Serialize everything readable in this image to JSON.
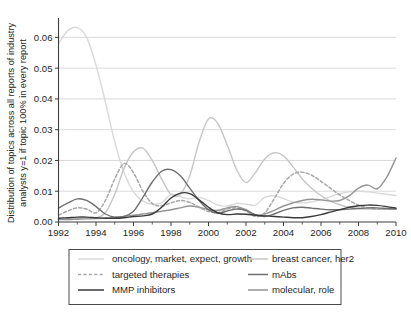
{
  "figure": {
    "ylabel_line1": "Distribution of topics across all reports of industry",
    "ylabel_line2": "analysts y=1 if topic 100% in every report"
  },
  "axes": {
    "y_ticks": [
      "0.00",
      "0.01",
      "0.02",
      "0.03",
      "0.04",
      "0.05",
      "0.06"
    ],
    "x_ticks": [
      "1992",
      "1994",
      "1996",
      "1998",
      "2000",
      "2002",
      "2004",
      "2006",
      "2008",
      "2010"
    ]
  },
  "legend": {
    "entries": [
      {
        "label": "oncology, market, expect, growth",
        "color": "#d9d9d9",
        "style": "solid"
      },
      {
        "label": "breast cancer, her2",
        "color": "#c6c6c6",
        "style": "solid"
      },
      {
        "label": "targeted therapies",
        "color": "#a8a8a8",
        "style": "dashed"
      },
      {
        "label": "mAbs",
        "color": "#6f6f6f",
        "style": "solid"
      },
      {
        "label": "MMP inhibitors",
        "color": "#3a3a3a",
        "style": "solid"
      },
      {
        "label": "molecular, role",
        "color": "#949494",
        "style": "solid"
      }
    ]
  },
  "chart_data": {
    "type": "line",
    "title": "",
    "xlabel": "",
    "ylabel": "Distribution of topics across all reports of industry analysts y=1 if topic 100% in every report",
    "xlim": [
      1992,
      2010
    ],
    "ylim": [
      0.0,
      0.065
    ],
    "grid": true,
    "legend_position": "below",
    "x": [
      1992,
      1992.5,
      1993,
      1993.5,
      1994,
      1994.5,
      1995,
      1995.5,
      1996,
      1996.5,
      1997,
      1997.5,
      1998,
      1998.5,
      1999,
      1999.5,
      2000,
      2000.5,
      2001,
      2001.5,
      2002,
      2002.5,
      2003,
      2003.5,
      2004,
      2004.5,
      2005,
      2005.5,
      2006,
      2006.5,
      2007,
      2007.5,
      2008,
      2008.5,
      2009,
      2009.5,
      2010
    ],
    "series": [
      {
        "name": "oncology, market, expect, growth",
        "color": "#d9d9d9",
        "style": "solid",
        "values": [
          0.058,
          0.0622,
          0.0632,
          0.06,
          0.051,
          0.039,
          0.026,
          0.016,
          0.0098,
          0.0068,
          0.0058,
          0.0062,
          0.009,
          0.0082,
          0.0075,
          0.008,
          0.007,
          0.0055,
          0.0052,
          0.006,
          0.0058,
          0.0055,
          0.008,
          0.0085,
          0.0076,
          0.0065,
          0.0062,
          0.0065,
          0.0072,
          0.0082,
          0.0092,
          0.0098,
          0.01,
          0.0098,
          0.0094,
          0.009,
          0.0086
        ]
      },
      {
        "name": "breast cancer, her2",
        "color": "#c6c6c6",
        "style": "solid",
        "values": [
          0.001,
          0.001,
          0.0012,
          0.0013,
          0.0014,
          0.003,
          0.009,
          0.0175,
          0.0228,
          0.024,
          0.02,
          0.014,
          0.009,
          0.009,
          0.015,
          0.026,
          0.0335,
          0.032,
          0.025,
          0.017,
          0.0128,
          0.016,
          0.0205,
          0.0225,
          0.0215,
          0.018,
          0.014,
          0.011,
          0.0086,
          0.0068,
          0.0056,
          0.0048,
          0.0044,
          0.0042,
          0.0042,
          0.0042,
          0.0044
        ]
      },
      {
        "name": "targeted therapies",
        "color": "#a8a8a8",
        "style": "dashed",
        "values": [
          0.0022,
          0.0036,
          0.0046,
          0.0042,
          0.003,
          0.007,
          0.014,
          0.019,
          0.016,
          0.01,
          0.006,
          0.0052,
          0.0062,
          0.007,
          0.0064,
          0.0048,
          0.0034,
          0.003,
          0.0042,
          0.0046,
          0.0036,
          0.0018,
          0.003,
          0.0075,
          0.0125,
          0.0155,
          0.0162,
          0.0152,
          0.0132,
          0.011,
          0.0088,
          0.007,
          0.0055,
          0.0046,
          0.0042,
          0.0042,
          0.0044
        ]
      },
      {
        "name": "mAbs",
        "color": "#6f6f6f",
        "style": "solid",
        "values": [
          0.0045,
          0.0062,
          0.0075,
          0.007,
          0.005,
          0.0026,
          0.0016,
          0.0018,
          0.0035,
          0.008,
          0.013,
          0.0165,
          0.017,
          0.015,
          0.011,
          0.007,
          0.004,
          0.0028,
          0.0036,
          0.0042,
          0.0038,
          0.0024,
          0.0018,
          0.0026,
          0.0038,
          0.0046,
          0.0048,
          0.0045,
          0.0042,
          0.004,
          0.004,
          0.0042,
          0.0044,
          0.0046,
          0.0046,
          0.0044,
          0.0042
        ]
      },
      {
        "name": "MMP inhibitors",
        "color": "#3a3a3a",
        "style": "solid",
        "values": [
          0.0012,
          0.0014,
          0.0016,
          0.0016,
          0.0014,
          0.0012,
          0.0012,
          0.0014,
          0.0018,
          0.002,
          0.0026,
          0.0048,
          0.0078,
          0.0094,
          0.0092,
          0.0072,
          0.0048,
          0.003,
          0.0024,
          0.0026,
          0.0025,
          0.0022,
          0.002,
          0.0018,
          0.0016,
          0.0014,
          0.0014,
          0.0018,
          0.0024,
          0.0032,
          0.004,
          0.0048,
          0.0053,
          0.0055,
          0.0054,
          0.005,
          0.0045
        ]
      },
      {
        "name": "molecular, role",
        "color": "#949494",
        "style": "solid",
        "values": [
          0.0008,
          0.0008,
          0.0009,
          0.001,
          0.0011,
          0.0013,
          0.0015,
          0.0018,
          0.0022,
          0.0026,
          0.003,
          0.0035,
          0.004,
          0.0046,
          0.0052,
          0.0048,
          0.004,
          0.0038,
          0.0046,
          0.005,
          0.004,
          0.0022,
          0.0026,
          0.0038,
          0.0052,
          0.0062,
          0.007,
          0.0074,
          0.0072,
          0.0068,
          0.007,
          0.0085,
          0.011,
          0.012,
          0.0108,
          0.0145,
          0.0208
        ]
      }
    ]
  }
}
